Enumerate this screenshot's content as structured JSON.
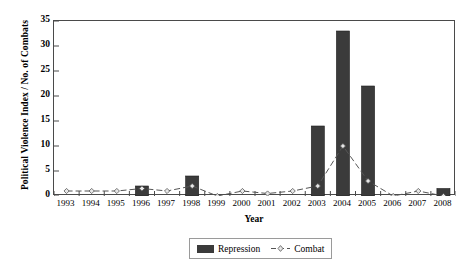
{
  "chart_data": {
    "type": "bar",
    "title": "",
    "xlabel": "Year",
    "ylabel": "Political Violence Index / No. of Combats",
    "categories": [
      "1993",
      "1994",
      "1995",
      "1996",
      "1997",
      "1998",
      "1999",
      "2000",
      "2001",
      "2002",
      "2003",
      "2004",
      "2005",
      "2006",
      "2007",
      "2008"
    ],
    "ylim": [
      0,
      35
    ],
    "ytick_values": [
      0,
      5,
      10,
      15,
      20,
      25,
      30,
      35
    ],
    "ytick_labels": [
      "0",
      "5",
      "10",
      "15",
      "20",
      "25",
      "30",
      "35"
    ],
    "grid": false,
    "legend_position": "bottom-center",
    "series": [
      {
        "name": "Repression",
        "kind": "bar",
        "color": "#3b3b3b",
        "values": [
          0,
          0,
          0,
          2,
          0,
          4,
          0,
          0,
          0,
          0,
          14,
          33,
          22,
          0,
          0,
          1.5
        ]
      },
      {
        "name": "Combat",
        "kind": "line",
        "color": "#555555",
        "line_style": "dashed",
        "marker": "diamond",
        "values": [
          1,
          1,
          1,
          1.5,
          1,
          2,
          0,
          1,
          0.5,
          1,
          2,
          10,
          3,
          0,
          1,
          0
        ]
      }
    ]
  },
  "legend": {
    "repression_label": "Repression",
    "combat_label": "Combat"
  },
  "axes": {
    "x_title": "Year",
    "y_title": "Political Violence Index / No. of Combats"
  }
}
